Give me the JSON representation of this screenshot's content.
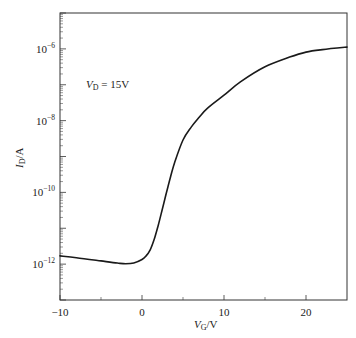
{
  "chart_data": {
    "type": "line",
    "title": "",
    "xlabel": "V_G/V",
    "xlabel_main": "V",
    "xlabel_sub": "G",
    "xlabel_unit": "/V",
    "ylabel": "I_D/A",
    "ylabel_main": "I",
    "ylabel_sub": "D",
    "ylabel_unit": "/A",
    "yscale": "log",
    "xlim": [
      -10,
      25
    ],
    "ylim": [
      1e-13,
      1e-05
    ],
    "grid": false,
    "legend": null,
    "x_ticks": [
      -10,
      0,
      10,
      20
    ],
    "x_tick_labels": [
      "−10",
      "0",
      "10",
      "20"
    ],
    "x_minor_ticks": [
      -5,
      5,
      15
    ],
    "y_ticks": [
      1e-06,
      1e-08,
      1e-10,
      1e-12
    ],
    "y_tick_labels": [
      {
        "base": "10",
        "exp": "−6"
      },
      {
        "base": "10",
        "exp": "−8"
      },
      {
        "base": "10",
        "exp": "−10"
      },
      {
        "base": "10",
        "exp": "−12"
      }
    ],
    "annotation": {
      "main": "V",
      "sub": "D",
      "text": " = 15V",
      "x": -6,
      "y": 2e-07
    },
    "series": [
      {
        "name": "V_D = 15V",
        "color": "#1a1a1a",
        "x": [
          -10,
          -8,
          -5,
          -3,
          -2,
          -1,
          0,
          0.5,
          1,
          1.5,
          2,
          2.5,
          3,
          3.5,
          4,
          5,
          6,
          7,
          8,
          10,
          12,
          15,
          18,
          20,
          22,
          25
        ],
        "log10_y": [
          -11.77,
          -11.82,
          -11.91,
          -11.97,
          -11.99,
          -11.97,
          -11.87,
          -11.77,
          -11.6,
          -11.3,
          -10.9,
          -10.45,
          -9.99,
          -9.55,
          -9.15,
          -8.54,
          -8.18,
          -7.9,
          -7.65,
          -7.29,
          -6.92,
          -6.5,
          -6.23,
          -6.09,
          -6.02,
          -5.95
        ]
      }
    ]
  }
}
